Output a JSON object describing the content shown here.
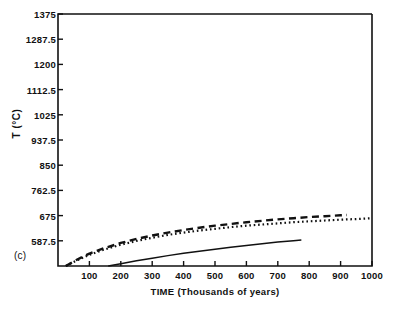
{
  "panel": {
    "label": "(c)"
  },
  "chart_data": {
    "type": "line",
    "title": "",
    "xlabel": "TIME (Thousands of years)",
    "ylabel": "T (°C)",
    "xlim": [
      0,
      1000
    ],
    "ylim": [
      500,
      1375
    ],
    "grid": false,
    "legend": "none",
    "xticks": [
      100,
      200,
      300,
      400,
      500,
      600,
      700,
      800,
      900,
      1000
    ],
    "xtick_labels": [
      "100",
      "200",
      "300",
      "400",
      "500",
      "600",
      "700",
      "800",
      "900",
      "1000"
    ],
    "yticks": [
      587.5,
      675,
      762.5,
      850,
      937.5,
      1025,
      1112.5,
      1200,
      1287.5,
      1375
    ],
    "ytick_labels": [
      "587.5",
      "675",
      "762.5",
      "850",
      "937.5",
      "1025",
      "1112.5",
      "1200",
      "1287.5",
      "1375"
    ],
    "series": [
      {
        "name": "curve-dashed",
        "style": "dashed",
        "color": "#111111",
        "x": [
          25,
          50,
          75,
          100,
          150,
          200,
          250,
          300,
          350,
          400,
          450,
          500,
          550,
          600,
          650,
          700,
          750,
          800,
          850,
          900,
          920
        ],
        "y": [
          500,
          516,
          530,
          543,
          563,
          580,
          594,
          606,
          616,
          625,
          633,
          640,
          646,
          652,
          657,
          662,
          666,
          670,
          673,
          676,
          677
        ]
      },
      {
        "name": "curve-dotted",
        "style": "dotted",
        "color": "#111111",
        "x": [
          25,
          50,
          75,
          100,
          150,
          200,
          250,
          300,
          350,
          400,
          450,
          500,
          550,
          600,
          650,
          700,
          750,
          800,
          850,
          900,
          950,
          1000
        ],
        "y": [
          500,
          514,
          527,
          539,
          558,
          574,
          587,
          598,
          608,
          616,
          623,
          629,
          635,
          640,
          644,
          648,
          652,
          655,
          658,
          661,
          663,
          666
        ]
      },
      {
        "name": "curve-solid",
        "style": "solid",
        "color": "#111111",
        "x": [
          160,
          200,
          250,
          300,
          350,
          400,
          450,
          500,
          550,
          600,
          650,
          700,
          750,
          775
        ],
        "y": [
          500,
          508,
          518,
          527,
          536,
          544,
          551,
          558,
          565,
          571,
          577,
          583,
          588,
          590
        ]
      }
    ]
  }
}
